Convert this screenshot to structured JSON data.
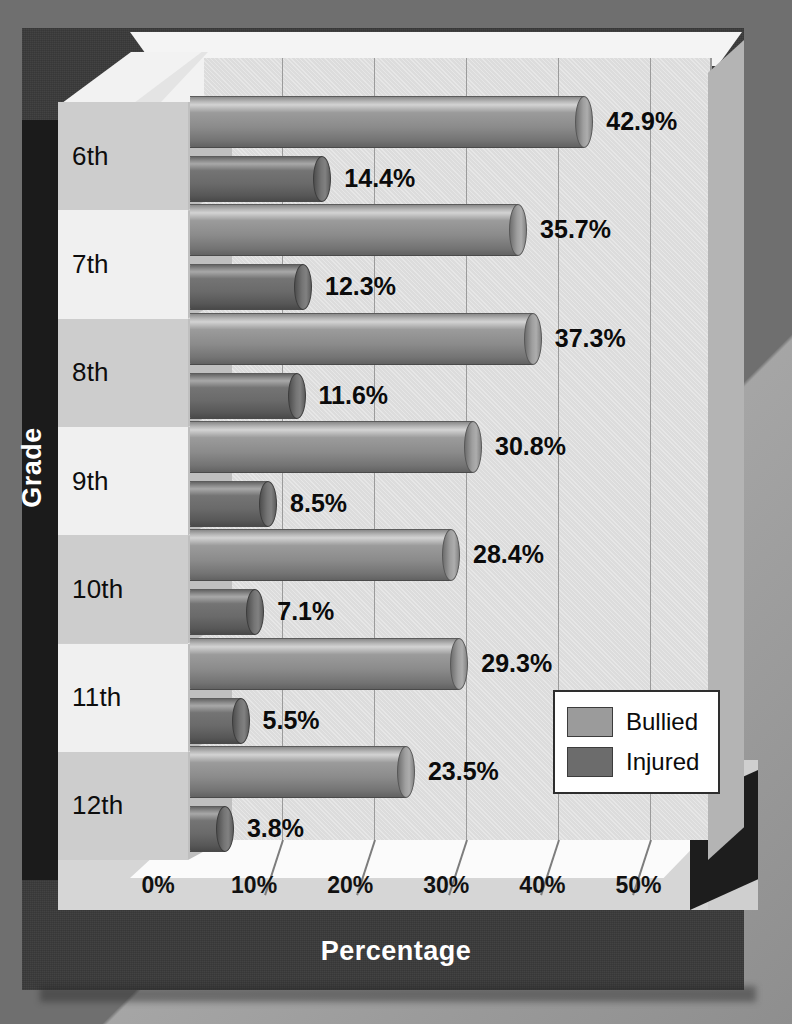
{
  "chart_data": {
    "type": "bar",
    "orientation": "horizontal",
    "title": "",
    "xlabel": "Percentage",
    "ylabel": "Grade",
    "categories": [
      "6th",
      "7th",
      "8th",
      "9th",
      "10th",
      "11th",
      "12th"
    ],
    "xlim": [
      0,
      57
    ],
    "xticks": [
      "0%",
      "10%",
      "20%",
      "30%",
      "40%",
      "50%"
    ],
    "xtick_values": [
      0,
      10,
      20,
      30,
      40,
      50
    ],
    "grid": true,
    "legend_position": "lower right",
    "series": [
      {
        "name": "Bullied",
        "color": "#9b9b9b",
        "values": [
          42.9,
          35.7,
          37.3,
          30.8,
          28.4,
          29.3,
          23.5
        ],
        "labels": [
          "42.9%",
          "35.7%",
          "37.3%",
          "30.8%",
          "28.4%",
          "29.3%",
          "23.5%"
        ]
      },
      {
        "name": "Injured",
        "color": "#6c6c6c",
        "values": [
          14.4,
          12.3,
          11.6,
          8.5,
          7.1,
          5.5,
          3.8
        ],
        "labels": [
          "14.4%",
          "12.3%",
          "11.6%",
          "8.5%",
          "7.1%",
          "5.5%",
          "3.8%"
        ]
      }
    ]
  },
  "axes": {
    "y_title": "Grade",
    "x_title": "Percentage"
  },
  "legend": {
    "entries": [
      {
        "label": "Bullied",
        "color": "#9b9b9b"
      },
      {
        "label": "Injured",
        "color": "#6c6c6c"
      }
    ]
  },
  "colors": {
    "backdrop": "#6f6f6f",
    "board": "#3a3a3a",
    "board_spine": "#1b1b1b",
    "wall": "#dcdcdc",
    "floor": "#fbfbfb",
    "panel_light": "#f0f0f0",
    "panel_dark": "#cdcdcd",
    "gridline": "#9b9b9b",
    "label_text": "#0b0b0b",
    "title_text": "#ffffff"
  }
}
